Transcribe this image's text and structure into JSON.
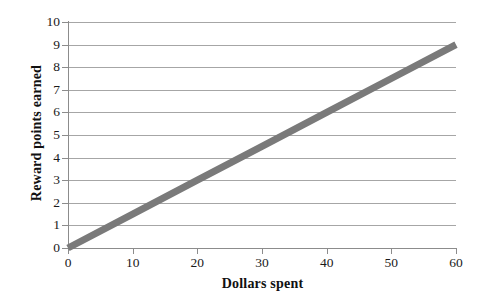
{
  "chart_data": {
    "type": "line",
    "title": "",
    "xlabel": "Dollars spent",
    "ylabel": "Reward points earned",
    "xlim": [
      0,
      60
    ],
    "ylim": [
      0,
      10
    ],
    "xticks": [
      0,
      10,
      20,
      30,
      40,
      50,
      60
    ],
    "yticks": [
      0,
      1,
      2,
      3,
      4,
      5,
      6,
      7,
      8,
      9,
      10
    ],
    "grid": "horizontal",
    "legend": "none",
    "series": [
      {
        "name": "Reward points",
        "x": [
          0,
          10,
          20,
          30,
          40,
          50,
          60
        ],
        "values": [
          0,
          1.5,
          3,
          4.5,
          6,
          7.5,
          9
        ],
        "color": "#7a7a7a",
        "line_width": 7
      }
    ],
    "annotations": []
  },
  "axes": {
    "x_tick_labels": [
      "0",
      "10",
      "20",
      "30",
      "40",
      "50",
      "60"
    ],
    "y_tick_labels": [
      "0",
      "1",
      "2",
      "3",
      "4",
      "5",
      "6",
      "7",
      "8",
      "9",
      "10"
    ],
    "x_title": "Dollars spent",
    "y_title": "Reward points earned"
  },
  "colors": {
    "line": "#7a7a7a",
    "grid": "#a6a6a6",
    "axis": "#8c8c8c",
    "text": "#111111",
    "background": "#ffffff"
  }
}
